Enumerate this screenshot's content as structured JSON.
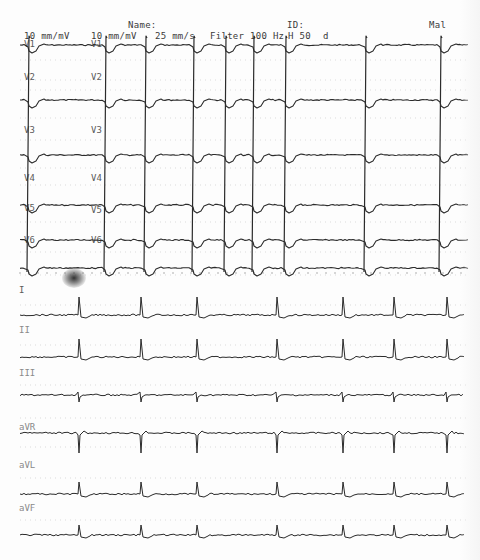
{
  "header": {
    "name_label": "Name:",
    "id_label": "ID:",
    "sex": "Mal",
    "gain_1": "10 mm/mV",
    "gain_2": "10 mm/mV",
    "speed": "25 mm/s",
    "filter": "Filter 100 Hz",
    "hum_filter": "H 50",
    "flag": "d"
  },
  "colors": {
    "paper": "#fdfdfd",
    "trace": "#2b2b2b",
    "grid_dots": "#c8c8c8",
    "label": "#5a5a5a"
  },
  "upper_section": {
    "leads_col1": [
      "V1",
      "V2",
      "V3",
      "V4",
      "V5",
      "V6"
    ],
    "leads_col2": [
      "V1",
      "V2",
      "V3",
      "V4",
      "V5",
      "V6"
    ],
    "baselines_y": [
      45,
      100,
      155,
      205,
      240,
      268
    ],
    "beat_x": [
      28,
      105,
      145,
      193,
      225,
      253,
      285,
      365,
      440
    ],
    "rhythm": "wide-complex paced rhythm, tall R waves across precordial leads"
  },
  "lower_section": {
    "leads": [
      "I",
      "II",
      "III",
      "aVR",
      "aVL",
      "aVF"
    ],
    "label_y": [
      291,
      330,
      373,
      428,
      465,
      508
    ],
    "baselines_y": [
      315,
      357,
      395,
      433,
      494,
      535
    ],
    "beat_x": [
      78,
      140,
      196,
      276,
      342,
      393,
      446
    ],
    "polarity": [
      "up",
      "up",
      "biphasic",
      "down",
      "up",
      "up"
    ]
  }
}
